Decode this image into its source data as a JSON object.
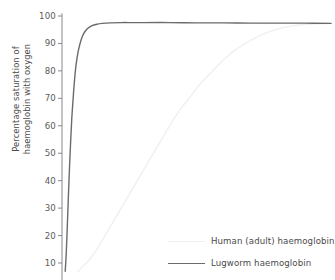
{
  "chart_data": {
    "type": "line",
    "title": "",
    "xlabel": "",
    "ylabel": "Percentage saturation of\nhaemoglobin with oxygen",
    "ylim": [
      6,
      101
    ],
    "xlim": [
      0,
      100
    ],
    "yticks": [
      100,
      90,
      80,
      70,
      60,
      50,
      40,
      30,
      20,
      10
    ],
    "ytick_labels": [
      "100",
      "90",
      "80",
      "70",
      "60",
      "50",
      "40",
      "30",
      "20",
      "10"
    ],
    "xticks": [],
    "xtick_labels": [],
    "grid": false,
    "legend_position": "lower right",
    "series": [
      {
        "name": "Human (adult) haemoglobin",
        "color": "#f0f0f0",
        "linewidth": 1.4,
        "x": [
          6,
          8,
          10,
          13,
          16,
          19,
          22,
          25,
          28,
          31,
          34,
          37,
          40,
          44,
          48,
          52,
          56,
          60,
          65,
          70,
          75,
          80,
          85,
          90,
          95,
          100
        ],
        "y": [
          7,
          9,
          11,
          15,
          20,
          25,
          30,
          35,
          40,
          45,
          50,
          55,
          60,
          66,
          71,
          76,
          80,
          84,
          88,
          91,
          93.5,
          95.2,
          96.3,
          96.9,
          97.2,
          97.3
        ]
      },
      {
        "name": "Lugworm haemoglobin",
        "color": "#6b6b6b",
        "linewidth": 1.4,
        "x": [
          1.2,
          1.6,
          2.0,
          2.4,
          2.8,
          3.2,
          3.6,
          4.0,
          4.6,
          5.2,
          6.0,
          7.0,
          8.0,
          9.5,
          11,
          13,
          15,
          18,
          22,
          26,
          30,
          40,
          50,
          60,
          70,
          80,
          90,
          100
        ],
        "y": [
          7,
          14,
          24,
          35,
          45,
          54,
          62,
          68,
          76,
          82,
          87,
          91,
          93.5,
          95.4,
          96.4,
          97.0,
          97.3,
          97.5,
          97.6,
          97.6,
          97.6,
          97.6,
          97.5,
          97.5,
          97.4,
          97.4,
          97.4,
          97.3
        ]
      }
    ]
  },
  "axis": {
    "color": "#888888",
    "tick_color": "#888888",
    "label_color": "#5a5a5a"
  },
  "legend": {
    "entries": [
      {
        "label": "Human (adult) haemoglobin",
        "color": "#f0f0f0"
      },
      {
        "label": "Lugworm haemoglobin",
        "color": "#6b6b6b"
      }
    ]
  }
}
